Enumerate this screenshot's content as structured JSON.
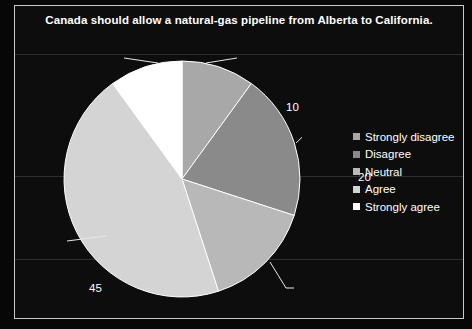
{
  "chart_data": {
    "type": "pie",
    "title": "Canada should allow a natural-gas pipeline from Alberta to California.",
    "categories": [
      "Strongly disagree",
      "Disagree",
      "Neutral",
      "Agree",
      "Strongly agree"
    ],
    "values": [
      10,
      20,
      15,
      45,
      10
    ],
    "labels": [
      "10",
      "20",
      "15",
      "45",
      "10"
    ],
    "colors": [
      "#a8a8a8",
      "#8a8a8a",
      "#b8b8b8",
      "#d4d4d4",
      "#ffffff"
    ],
    "total": 100,
    "start_angle": 0,
    "direction": "clockwise",
    "legend_position": "right",
    "grid": true,
    "background": "#0d0d0d",
    "text_color": "#ffffff",
    "border_color": "#c9c9c9",
    "xlabel": "",
    "ylabel": ""
  },
  "legend": {
    "items": [
      {
        "label": "Strongly disagree",
        "color": "#a8a8a8"
      },
      {
        "label": "Disagree",
        "color": "#8a8a8a"
      },
      {
        "label": "Neutral",
        "color": "#b8b8b8"
      },
      {
        "label": "Agree",
        "color": "#d4d4d4"
      },
      {
        "label": "Strongly agree",
        "color": "#ffffff"
      }
    ]
  }
}
